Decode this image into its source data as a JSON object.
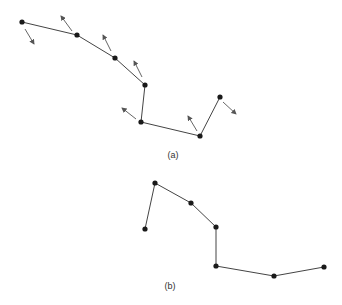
{
  "diagram_a": {
    "label": "(a)",
    "label_pos": [
      173,
      155
    ],
    "points": [
      [
        22,
        22
      ],
      [
        77,
        35
      ],
      [
        115,
        58
      ],
      [
        145,
        85
      ],
      [
        141,
        122
      ],
      [
        200,
        136
      ],
      [
        220,
        97
      ]
    ],
    "arrows": [
      [
        [
          25,
          29
        ],
        [
          34,
          44
        ]
      ],
      [
        [
          72,
          31
        ],
        [
          61,
          16
        ]
      ],
      [
        [
          111,
          51
        ],
        [
          103,
          35
        ]
      ],
      [
        [
          142,
          77
        ],
        [
          134,
          61
        ]
      ],
      [
        [
          136,
          119
        ],
        [
          122,
          108
        ]
      ],
      [
        [
          197,
          131
        ],
        [
          188,
          116
        ]
      ],
      [
        [
          223,
          102
        ],
        [
          236,
          114
        ]
      ]
    ]
  },
  "diagram_b": {
    "label": "(b)",
    "label_pos": [
      170,
      286
    ],
    "points": [
      [
        145,
        229
      ],
      [
        155,
        183
      ],
      [
        191,
        203
      ],
      [
        216,
        227
      ],
      [
        216,
        266
      ],
      [
        274,
        276
      ],
      [
        324,
        267
      ]
    ]
  },
  "colors": {
    "line": "#444444",
    "point": "#1a1a1a",
    "arrow": "#555555"
  }
}
